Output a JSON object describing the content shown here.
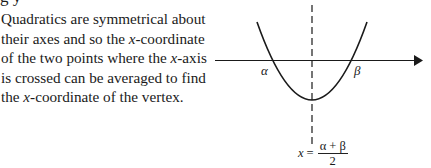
{
  "heading_fragment": "g y",
  "paragraph": {
    "lines": [
      "Quadratics are symmetrical about",
      "their axes and so the {x}-coordinate",
      "of the two points where the {x}-axis",
      "is crossed can be averaged to find",
      "the {x}-coordinate of the vertex."
    ],
    "line_1": "Quadratics are symmetrical about",
    "line_2_a": "their axes and so the ",
    "line_2_var": "x",
    "line_2_b": "-coordinate",
    "line_3_a": "of the two points where the ",
    "line_3_var": "x",
    "line_3_b": "-axis",
    "line_4": "is crossed can be averaged to find",
    "line_5_a": "the ",
    "line_5_var": "x",
    "line_5_b": "-coordinate of the vertex."
  },
  "diagram": {
    "type": "parabola-symmetry",
    "root_left_label": "α",
    "root_right_label": "β",
    "axis_of_symmetry": "dashed vertical line through vertex",
    "stroke_color": "#1a1a1a"
  },
  "formula": {
    "lhs": "x",
    "equals": "=",
    "numerator": "α + β",
    "denominator": "2"
  }
}
